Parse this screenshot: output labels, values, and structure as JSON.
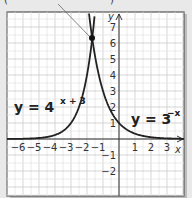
{
  "chart_data": {
    "type": "line",
    "title": "",
    "xlabel": "x",
    "ylabel": "y",
    "xlim": [
      -7,
      4
    ],
    "ylim": [
      -3.6,
      7.8
    ],
    "grid": true,
    "x_ticks": [
      -6,
      -5,
      -4,
      -3,
      -2,
      -1,
      1,
      2,
      3
    ],
    "y_ticks": [
      7,
      6,
      5,
      4,
      3,
      2,
      1,
      -1,
      -2
    ],
    "series": [
      {
        "name": "y = 4^(x + 3)",
        "label_base": "y = 4",
        "label_exp": "x + 3",
        "function": "4^(x+3)",
        "color": "#222222"
      },
      {
        "name": "y = 3^(-x)",
        "label_base": "y = 3",
        "label_exp": "−x",
        "function": "3^(-x)",
        "color": "#222222"
      }
    ],
    "annotations": [
      {
        "type": "point",
        "x": -1.67,
        "y": 6.29,
        "description": "intersection point with leader line to a truncated label above"
      }
    ]
  },
  "labels": {
    "x_axis": "x",
    "y_axis": "y",
    "left_eq_base": "y = 4",
    "left_eq_exp": "x + 3",
    "right_eq_base": "y = 3",
    "right_eq_exp": "−x"
  },
  "colors": {
    "background": "#e9e9e9",
    "plot_bg": "#ffffff",
    "grid": "#c8c8c8",
    "frame": "#555555",
    "curve": "#222222"
  }
}
